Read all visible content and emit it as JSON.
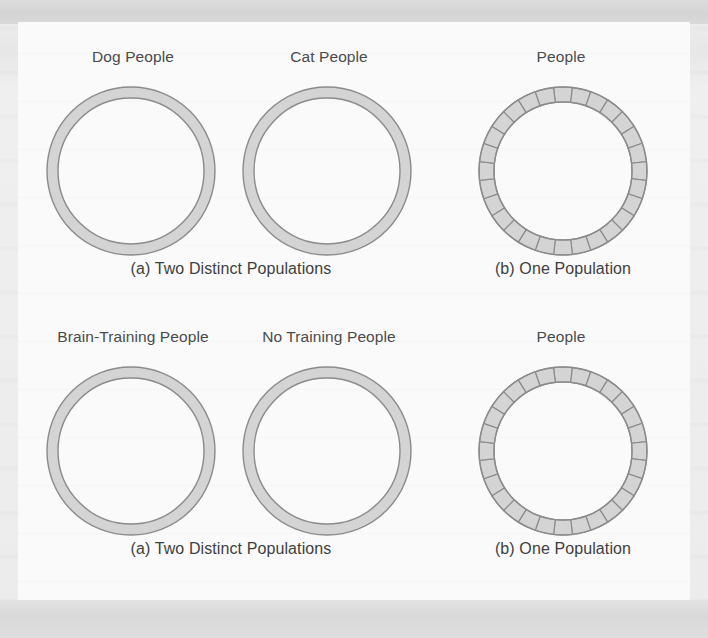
{
  "figure": {
    "panel_background": "#fafafa",
    "page_background": "#e9e9e9",
    "ring_fill": "#d4d4d4",
    "ring_stroke": "#8b8b8b",
    "text_color": "#3f3f3f",
    "rows": [
      {
        "id": "row-1",
        "labels": {
          "left_ring": "Dog People",
          "middle_ring": "Cat People",
          "right_ring": "People"
        },
        "captions": {
          "left": "(a) Two Distinct Populations",
          "right": "(b) One Population"
        }
      },
      {
        "id": "row-2",
        "labels": {
          "left_ring": "Brain-Training People",
          "middle_ring": "No Training People",
          "right_ring": "People"
        },
        "captions": {
          "left": "(a) Two Distinct Populations",
          "right": "(b) One Population"
        }
      }
    ]
  },
  "chart_data": {
    "type": "diagram",
    "panels": [
      {
        "row": 1,
        "panel": "a",
        "caption": "(a) Two Distinct Populations",
        "rings": [
          {
            "label": "Dog People",
            "style": "plain",
            "segments": 0,
            "outer_diameter_px": 170,
            "band_width_px": 11
          },
          {
            "label": "Cat People",
            "style": "plain",
            "segments": 0,
            "outer_diameter_px": 170,
            "band_width_px": 11
          }
        ]
      },
      {
        "row": 1,
        "panel": "b",
        "caption": "(b) One Population",
        "rings": [
          {
            "label": "People",
            "style": "segmented",
            "segments": 28,
            "outer_diameter_px": 170,
            "band_width_px": 15
          }
        ]
      },
      {
        "row": 2,
        "panel": "a",
        "caption": "(a) Two Distinct Populations",
        "rings": [
          {
            "label": "Brain-Training People",
            "style": "plain",
            "segments": 0,
            "outer_diameter_px": 170,
            "band_width_px": 11
          },
          {
            "label": "No Training People",
            "style": "plain",
            "segments": 0,
            "outer_diameter_px": 170,
            "band_width_px": 11
          }
        ]
      },
      {
        "row": 2,
        "panel": "b",
        "caption": "(b) One Population",
        "rings": [
          {
            "label": "People",
            "style": "segmented",
            "segments": 28,
            "outer_diameter_px": 170,
            "band_width_px": 15
          }
        ]
      }
    ]
  }
}
